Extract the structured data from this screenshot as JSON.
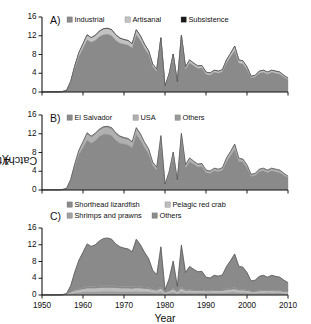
{
  "figure": {
    "y_axis_label_main": "Catch (t • 10",
    "y_axis_label_exp": "4",
    "y_axis_label_close": ")",
    "x_axis_label": "Year"
  },
  "axes": {
    "y_ticks": [
      "0",
      "4",
      "8",
      "12",
      "16"
    ],
    "y_values": [
      0,
      4,
      8,
      12,
      16
    ],
    "x_ticks": [
      "1950",
      "1960",
      "1970",
      "1980",
      "1990",
      "2000",
      "2010"
    ],
    "x_values": [
      1950,
      1960,
      1970,
      1980,
      1990,
      2000,
      2010
    ],
    "ylim": [
      0,
      16
    ],
    "xlim": [
      1950,
      2010
    ]
  },
  "colors": {
    "industrial": "#8a8a8a",
    "artisanal": "#c2c2c2",
    "subsistence": "#1a1a1a",
    "el_salvador": "#8a8a8a",
    "usa": "#b0b0b0",
    "others_b": "#9a9a9a",
    "shorthead_lizardfish": "#8a8a8a",
    "pelagic_red_crab": "#bdbdbd",
    "shrimps_and_prawns": "#a0a0a0",
    "others_c": "#8a8a8a",
    "axis": "#1a1a1a"
  },
  "panels": [
    {
      "letter": "A)",
      "legend": [
        {
          "label": "Industrial",
          "color": "#8a8a8a"
        },
        {
          "label": "Artisanal",
          "color": "#c2c2c2"
        },
        {
          "label": "Subsistence",
          "color": "#1a1a1a"
        }
      ]
    },
    {
      "letter": "B)",
      "legend": [
        {
          "label": "El Salvador",
          "color": "#8a8a8a"
        },
        {
          "label": "USA",
          "color": "#b0b0b0"
        },
        {
          "label": "Others",
          "color": "#9a9a9a"
        }
      ]
    },
    {
      "letter": "C)",
      "legend": [
        {
          "label": "Shorthead lizardfish",
          "color": "#8a8a8a"
        },
        {
          "label": "Pelagic red crab",
          "color": "#bdbdbd"
        },
        {
          "label": "Shrimps and prawns",
          "color": "#a0a0a0"
        },
        {
          "label": "Others",
          "color": "#8a8a8a"
        }
      ]
    }
  ],
  "chart_data": [
    {
      "type": "area",
      "panel": "A",
      "title": "",
      "xlabel": "Year",
      "ylabel": "Catch (t • 10^4)",
      "xlim": [
        1950,
        2010
      ],
      "ylim": [
        0,
        16
      ],
      "grid": false,
      "legend_position": "top",
      "stacked": true,
      "x": [
        1950,
        1951,
        1952,
        1953,
        1954,
        1955,
        1956,
        1957,
        1958,
        1959,
        1960,
        1961,
        1962,
        1963,
        1964,
        1965,
        1966,
        1967,
        1968,
        1969,
        1970,
        1971,
        1972,
        1973,
        1974,
        1975,
        1976,
        1977,
        1978,
        1979,
        1980,
        1981,
        1982,
        1983,
        1984,
        1985,
        1986,
        1987,
        1988,
        1989,
        1990,
        1991,
        1992,
        1993,
        1994,
        1995,
        1996,
        1997,
        1998,
        1999,
        2000,
        2001,
        2002,
        2003,
        2004,
        2005,
        2006,
        2007,
        2008,
        2009,
        2010
      ],
      "series": [
        {
          "name": "Industrial",
          "color": "#8a8a8a",
          "values": [
            0.05,
            0.05,
            0.05,
            0.05,
            0.05,
            0.1,
            0.3,
            2.0,
            5.0,
            7.6,
            9.3,
            11.1,
            10.6,
            11.0,
            11.8,
            12.2,
            12.3,
            12.0,
            11.0,
            10.4,
            10.2,
            10.0,
            9.4,
            12.2,
            11.0,
            9.3,
            8.0,
            5.4,
            4.4,
            10.6,
            1.0,
            3.4,
            7.2,
            1.8,
            11.0,
            4.8,
            6.2,
            5.6,
            5.0,
            5.1,
            3.8,
            3.6,
            4.2,
            4.0,
            4.3,
            6.2,
            7.5,
            8.8,
            6.2,
            6.0,
            4.8,
            3.0,
            3.2,
            4.0,
            4.2,
            3.8,
            4.2,
            4.0,
            3.8,
            3.2,
            2.6
          ]
        },
        {
          "name": "Artisanal",
          "color": "#c2c2c2",
          "values": [
            0.0,
            0.0,
            0.0,
            0.0,
            0.0,
            0.0,
            0.05,
            0.2,
            0.5,
            0.7,
            0.9,
            1.0,
            0.9,
            1.0,
            1.1,
            1.2,
            1.2,
            1.2,
            1.1,
            1.0,
            0.9,
            0.9,
            0.8,
            1.0,
            0.9,
            0.8,
            0.7,
            0.5,
            0.4,
            0.9,
            0.2,
            0.4,
            0.8,
            0.3,
            1.0,
            0.5,
            0.6,
            0.5,
            0.5,
            0.5,
            0.4,
            0.4,
            0.4,
            0.4,
            0.4,
            0.6,
            0.7,
            0.9,
            0.6,
            0.6,
            0.5,
            0.3,
            0.3,
            0.4,
            0.4,
            0.4,
            0.4,
            0.4,
            0.4,
            0.3,
            0.3
          ]
        },
        {
          "name": "Subsistence",
          "color": "#1a1a1a",
          "values": [
            0.0,
            0.0,
            0.0,
            0.0,
            0.0,
            0.0,
            0.0,
            0.05,
            0.1,
            0.1,
            0.1,
            0.1,
            0.1,
            0.1,
            0.1,
            0.1,
            0.1,
            0.1,
            0.1,
            0.1,
            0.1,
            0.1,
            0.1,
            0.1,
            0.1,
            0.1,
            0.1,
            0.05,
            0.05,
            0.1,
            0.05,
            0.05,
            0.1,
            0.05,
            0.1,
            0.05,
            0.05,
            0.05,
            0.05,
            0.05,
            0.05,
            0.05,
            0.05,
            0.05,
            0.05,
            0.05,
            0.05,
            0.1,
            0.05,
            0.05,
            0.05,
            0.05,
            0.05,
            0.05,
            0.05,
            0.05,
            0.05,
            0.05,
            0.05,
            0.05,
            0.05
          ]
        }
      ]
    },
    {
      "type": "area",
      "panel": "B",
      "title": "",
      "xlabel": "Year",
      "ylabel": "Catch (t • 10^4)",
      "xlim": [
        1950,
        2010
      ],
      "ylim": [
        0,
        16
      ],
      "grid": false,
      "legend_position": "top",
      "stacked": true,
      "x": [
        1950,
        1951,
        1952,
        1953,
        1954,
        1955,
        1956,
        1957,
        1958,
        1959,
        1960,
        1961,
        1962,
        1963,
        1964,
        1965,
        1966,
        1967,
        1968,
        1969,
        1970,
        1971,
        1972,
        1973,
        1974,
        1975,
        1976,
        1977,
        1978,
        1979,
        1980,
        1981,
        1982,
        1983,
        1984,
        1985,
        1986,
        1987,
        1988,
        1989,
        1990,
        1991,
        1992,
        1993,
        1994,
        1995,
        1996,
        1997,
        1998,
        1999,
        2000,
        2001,
        2002,
        2003,
        2004,
        2005,
        2006,
        2007,
        2008,
        2009,
        2010
      ],
      "series": [
        {
          "name": "El Salvador",
          "color": "#8a8a8a",
          "values": [
            0.05,
            0.05,
            0.05,
            0.05,
            0.05,
            0.1,
            0.3,
            2.0,
            5.0,
            7.6,
            9.0,
            10.6,
            10.0,
            10.5,
            11.4,
            11.9,
            11.9,
            11.6,
            10.6,
            10.0,
            9.8,
            9.6,
            9.0,
            11.8,
            10.6,
            9.0,
            7.7,
            5.2,
            4.2,
            10.2,
            1.0,
            3.3,
            7.0,
            1.7,
            10.7,
            4.7,
            6.0,
            5.5,
            4.9,
            5.0,
            3.7,
            3.5,
            4.1,
            3.9,
            4.2,
            6.0,
            7.3,
            8.6,
            6.1,
            5.9,
            4.7,
            2.9,
            3.1,
            3.9,
            4.1,
            3.7,
            4.1,
            3.9,
            3.7,
            3.1,
            2.6
          ]
        },
        {
          "name": "USA",
          "color": "#b0b0b0",
          "values": [
            0.0,
            0.0,
            0.0,
            0.0,
            0.0,
            0.0,
            0.0,
            0.15,
            0.4,
            0.6,
            0.9,
            1.2,
            1.1,
            1.2,
            1.2,
            1.2,
            1.2,
            1.2,
            1.1,
            1.1,
            1.0,
            1.0,
            0.9,
            1.1,
            1.0,
            0.8,
            0.7,
            0.5,
            0.4,
            1.0,
            0.15,
            0.4,
            0.8,
            0.3,
            1.0,
            0.5,
            0.6,
            0.4,
            0.4,
            0.4,
            0.3,
            0.3,
            0.3,
            0.3,
            0.3,
            0.5,
            0.6,
            0.8,
            0.4,
            0.4,
            0.4,
            0.25,
            0.25,
            0.3,
            0.3,
            0.3,
            0.3,
            0.3,
            0.3,
            0.25,
            0.2
          ]
        },
        {
          "name": "Others",
          "color": "#9a9a9a",
          "values": [
            0.0,
            0.0,
            0.0,
            0.0,
            0.0,
            0.0,
            0.05,
            0.1,
            0.2,
            0.3,
            0.4,
            0.4,
            0.4,
            0.4,
            0.4,
            0.4,
            0.5,
            0.5,
            0.5,
            0.4,
            0.4,
            0.4,
            0.4,
            0.4,
            0.4,
            0.4,
            0.4,
            0.25,
            0.25,
            0.4,
            0.1,
            0.15,
            0.3,
            0.15,
            0.4,
            0.2,
            0.25,
            0.25,
            0.25,
            0.25,
            0.25,
            0.25,
            0.25,
            0.25,
            0.25,
            0.35,
            0.35,
            0.4,
            0.3,
            0.3,
            0.25,
            0.2,
            0.2,
            0.25,
            0.25,
            0.25,
            0.25,
            0.25,
            0.25,
            0.2,
            0.15
          ]
        }
      ]
    },
    {
      "type": "area",
      "panel": "C",
      "title": "",
      "xlabel": "Year",
      "ylabel": "Catch (t • 10^4)",
      "xlim": [
        1950,
        2010
      ],
      "ylim": [
        0,
        16
      ],
      "grid": false,
      "legend_position": "top",
      "stacked": true,
      "x": [
        1950,
        1951,
        1952,
        1953,
        1954,
        1955,
        1956,
        1957,
        1958,
        1959,
        1960,
        1961,
        1962,
        1963,
        1964,
        1965,
        1966,
        1967,
        1968,
        1969,
        1970,
        1971,
        1972,
        1973,
        1974,
        1975,
        1976,
        1977,
        1978,
        1979,
        1980,
        1981,
        1982,
        1983,
        1984,
        1985,
        1986,
        1987,
        1988,
        1989,
        1990,
        1991,
        1992,
        1993,
        1994,
        1995,
        1996,
        1997,
        1998,
        1999,
        2000,
        2001,
        2002,
        2003,
        2004,
        2005,
        2006,
        2007,
        2008,
        2009,
        2010
      ],
      "series": [
        {
          "name": "Shrimps and prawns",
          "color": "#a0a0a0",
          "values": [
            0.02,
            0.02,
            0.02,
            0.02,
            0.02,
            0.05,
            0.1,
            0.3,
            0.5,
            0.6,
            0.7,
            0.8,
            0.8,
            0.8,
            0.85,
            0.9,
            0.9,
            0.9,
            0.85,
            0.8,
            0.8,
            0.8,
            0.8,
            0.85,
            0.8,
            0.8,
            0.75,
            0.6,
            0.55,
            0.8,
            0.2,
            0.45,
            0.7,
            0.3,
            0.8,
            0.5,
            0.55,
            0.5,
            0.5,
            0.5,
            0.45,
            0.45,
            0.5,
            0.5,
            0.5,
            0.6,
            0.65,
            0.7,
            0.55,
            0.55,
            0.5,
            0.4,
            0.4,
            0.45,
            0.5,
            0.45,
            0.5,
            0.45,
            0.45,
            0.4,
            0.3
          ]
        },
        {
          "name": "Pelagic red crab",
          "color": "#bdbdbd",
          "values": [
            0.0,
            0.0,
            0.0,
            0.0,
            0.0,
            0.0,
            0.05,
            0.2,
            0.4,
            0.5,
            0.6,
            0.7,
            0.7,
            0.7,
            0.75,
            0.8,
            0.8,
            0.8,
            0.75,
            0.7,
            0.7,
            0.7,
            0.65,
            0.7,
            0.7,
            0.65,
            0.6,
            0.45,
            0.4,
            0.65,
            0.15,
            0.3,
            0.55,
            0.25,
            0.65,
            0.4,
            0.45,
            0.4,
            0.4,
            0.4,
            0.35,
            0.35,
            0.4,
            0.4,
            0.4,
            0.5,
            0.55,
            0.6,
            0.45,
            0.45,
            0.4,
            0.3,
            0.3,
            0.35,
            0.4,
            0.35,
            0.4,
            0.35,
            0.35,
            0.3,
            0.25
          ]
        },
        {
          "name": "Shorthead lizardfish",
          "color": "#8a8a8a",
          "values": [
            0.0,
            0.0,
            0.0,
            0.0,
            0.0,
            0.0,
            0.05,
            0.15,
            0.3,
            0.4,
            0.5,
            0.6,
            0.55,
            0.6,
            0.6,
            0.6,
            0.6,
            0.6,
            0.6,
            0.55,
            0.55,
            0.55,
            0.5,
            0.6,
            0.55,
            0.5,
            0.45,
            0.35,
            0.3,
            0.5,
            0.1,
            0.25,
            0.45,
            0.2,
            0.5,
            0.3,
            0.35,
            0.3,
            0.3,
            0.3,
            0.3,
            0.3,
            0.3,
            0.3,
            0.3,
            0.4,
            0.45,
            0.5,
            0.35,
            0.35,
            0.3,
            0.25,
            0.25,
            0.3,
            0.3,
            0.3,
            0.3,
            0.3,
            0.3,
            0.25,
            0.2
          ]
        },
        {
          "name": "Others",
          "color": "#8a8a8a",
          "values": [
            0.03,
            0.03,
            0.03,
            0.03,
            0.03,
            0.05,
            0.15,
            1.55,
            4.3,
            6.8,
            8.4,
            10.1,
            9.55,
            9.9,
            10.7,
            11.2,
            11.3,
            11.0,
            10.0,
            9.45,
            9.15,
            8.95,
            8.35,
            11.15,
            9.95,
            8.25,
            6.9,
            4.5,
            3.6,
            9.55,
            0.8,
            2.85,
            6.4,
            1.35,
            9.95,
            4.15,
            5.45,
            4.95,
            4.35,
            4.45,
            3.15,
            2.95,
            3.5,
            3.3,
            3.6,
            5.3,
            6.6,
            8.0,
            5.5,
            5.3,
            4.15,
            2.4,
            2.6,
            3.35,
            3.5,
            3.15,
            3.5,
            3.35,
            3.15,
            2.6,
            2.2
          ]
        }
      ]
    }
  ]
}
